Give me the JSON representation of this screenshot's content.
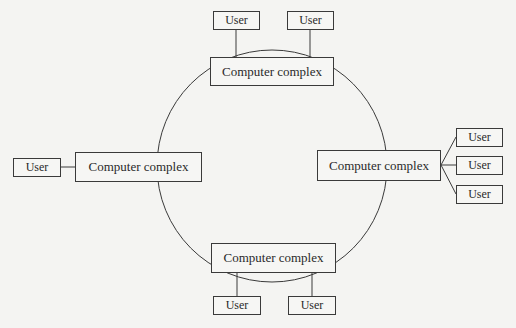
{
  "diagram": {
    "type": "ring-network",
    "title": "",
    "colors": {
      "line": "#3a3a3a",
      "background": "#f4f4f2",
      "text": "#2a2a2a"
    },
    "nodes": {
      "top": {
        "label": "Computer complex",
        "users": [
          "User",
          "User"
        ]
      },
      "left": {
        "label": "Computer complex",
        "users": [
          "User"
        ]
      },
      "right": {
        "label": "Computer complex",
        "users": [
          "User",
          "User",
          "User"
        ]
      },
      "bottom": {
        "label": "Computer complex",
        "users": [
          "User",
          "User"
        ]
      }
    },
    "ring": {
      "description": "Four computer complexes connected in a ring"
    }
  }
}
